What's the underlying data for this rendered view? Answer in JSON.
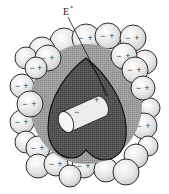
{
  "figure": {
    "label": "E",
    "label_superscript": "*",
    "colors": {
      "sphere_fill": "#e4e4e4",
      "sphere_stroke": "#1a1a1a",
      "reaction_field_region": "#9a9a9a",
      "cavity": "#555555",
      "solute": "#ececec"
    },
    "solute": {
      "neg": "−",
      "pos": "+"
    },
    "spheres": [
      {
        "cx": 64,
        "cy": 42,
        "r": 14,
        "neg": "",
        "pos": ""
      },
      {
        "cx": 86,
        "cy": 38,
        "r": 14,
        "neg": "−",
        "pos": "+"
      },
      {
        "cx": 108,
        "cy": 36,
        "r": 13,
        "neg": "−",
        "pos": "+"
      },
      {
        "cx": 133,
        "cy": 38,
        "r": 13,
        "neg": "−",
        "pos": "+"
      },
      {
        "cx": 42,
        "cy": 50,
        "r": 13,
        "neg": "",
        "pos": ""
      },
      {
        "cx": 26,
        "cy": 58,
        "r": 11,
        "neg": "",
        "pos": ""
      },
      {
        "cx": 48,
        "cy": 58,
        "r": 13,
        "neg": "−",
        "pos": "+"
      },
      {
        "cx": 36,
        "cy": 68,
        "r": 11,
        "neg": "−",
        "pos": "+"
      },
      {
        "cx": 124,
        "cy": 56,
        "r": 13,
        "neg": "−",
        "pos": "+"
      },
      {
        "cx": 145,
        "cy": 62,
        "r": 12,
        "neg": "",
        "pos": ""
      },
      {
        "cx": 135,
        "cy": 70,
        "r": 13,
        "neg": "−",
        "pos": "+"
      },
      {
        "cx": 22,
        "cy": 86,
        "r": 12,
        "neg": "−",
        "pos": "+"
      },
      {
        "cx": 143,
        "cy": 88,
        "r": 12,
        "neg": "−",
        "pos": "+"
      },
      {
        "cx": 30,
        "cy": 104,
        "r": 13,
        "neg": "−",
        "pos": "+"
      },
      {
        "cx": 150,
        "cy": 108,
        "r": 10,
        "neg": "",
        "pos": ""
      },
      {
        "cx": 22,
        "cy": 122,
        "r": 12,
        "neg": "−",
        "pos": "+"
      },
      {
        "cx": 144,
        "cy": 126,
        "r": 13,
        "neg": "−",
        "pos": "+"
      },
      {
        "cx": 26,
        "cy": 142,
        "r": 11,
        "neg": "",
        "pos": ""
      },
      {
        "cx": 38,
        "cy": 148,
        "r": 12,
        "neg": "−",
        "pos": "+"
      },
      {
        "cx": 148,
        "cy": 146,
        "r": 10,
        "neg": "",
        "pos": ""
      },
      {
        "cx": 136,
        "cy": 156,
        "r": 12,
        "neg": "",
        "pos": ""
      },
      {
        "cx": 38,
        "cy": 166,
        "r": 12,
        "neg": "",
        "pos": ""
      },
      {
        "cx": 56,
        "cy": 164,
        "r": 12,
        "neg": "−",
        "pos": "+"
      },
      {
        "cx": 84,
        "cy": 166,
        "r": 12,
        "neg": "−",
        "pos": "+"
      },
      {
        "cx": 106,
        "cy": 170,
        "r": 12,
        "neg": "",
        "pos": ""
      },
      {
        "cx": 126,
        "cy": 172,
        "r": 13,
        "neg": "",
        "pos": ""
      },
      {
        "cx": 70,
        "cy": 176,
        "r": 11,
        "neg": "",
        "pos": ""
      }
    ]
  }
}
